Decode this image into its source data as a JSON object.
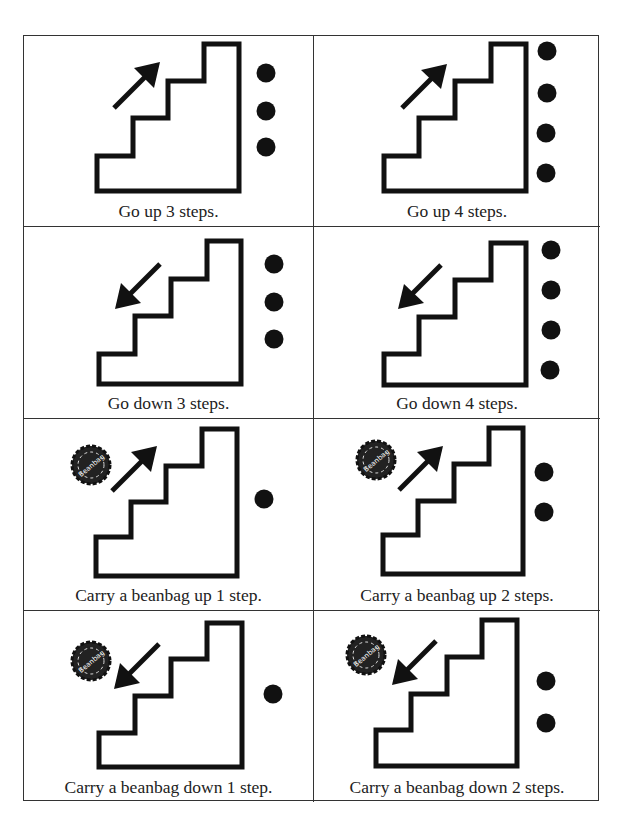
{
  "colors": {
    "ink": "#111111",
    "border": "#333333",
    "background": "#ffffff"
  },
  "cards": [
    {
      "caption": "Go up 3 steps.",
      "direction": "up",
      "count": 3,
      "beanbag": false,
      "icon": "stairs-up-icon"
    },
    {
      "caption": "Go up 4 steps.",
      "direction": "up",
      "count": 4,
      "beanbag": false,
      "icon": "stairs-up-icon"
    },
    {
      "caption": "Go down 3 steps.",
      "direction": "down",
      "count": 3,
      "beanbag": false,
      "icon": "stairs-down-icon"
    },
    {
      "caption": "Go down 4 steps.",
      "direction": "down",
      "count": 4,
      "beanbag": false,
      "icon": "stairs-down-icon"
    },
    {
      "caption": "Carry a beanbag up 1 step.",
      "direction": "up",
      "count": 1,
      "beanbag": true,
      "beanbag_label": "Beanbag",
      "icon": "stairs-up-icon"
    },
    {
      "caption": "Carry a beanbag up 2 steps.",
      "direction": "up",
      "count": 2,
      "beanbag": true,
      "beanbag_label": "Beanbag",
      "icon": "stairs-up-icon"
    },
    {
      "caption": "Carry a beanbag down 1 step.",
      "direction": "down",
      "count": 1,
      "beanbag": true,
      "beanbag_label": "Beanbag",
      "icon": "stairs-down-icon"
    },
    {
      "caption": "Carry a beanbag down 2 steps.",
      "direction": "down",
      "count": 2,
      "beanbag": true,
      "beanbag_label": "Beanbag",
      "icon": "stairs-down-icon"
    }
  ]
}
